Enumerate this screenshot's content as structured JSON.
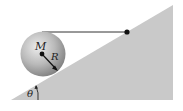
{
  "diagram": {
    "labels": {
      "mass": "M",
      "radius": "R",
      "angle": "θ"
    },
    "colors": {
      "incline": "#c8c8c8",
      "sphere_light": "#e6e6e6",
      "sphere_dark": "#8a8a8a",
      "string": "#333333",
      "dot": "#111111"
    }
  }
}
